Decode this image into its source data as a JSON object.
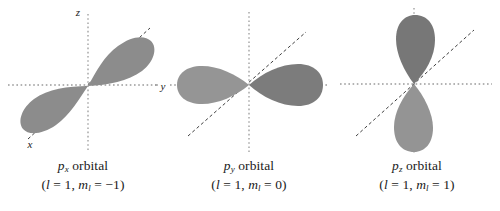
{
  "figure": {
    "background_color": "#ffffff",
    "lobe_color_light": "#8e8e8e",
    "lobe_color_dark": "#7b7b7b",
    "axis_color": "#9a9a9a",
    "diagonal_color": "#3a3a3a",
    "text_color": "#1a1a1a"
  },
  "panels": [
    {
      "id": "px-orbital",
      "orbital_symbol": "p",
      "orbital_subscript": "x",
      "orbital_word": "orbital",
      "quantum_l_symbol": "l",
      "quantum_l_value": "1",
      "quantum_m_symbol": "m",
      "quantum_m_subscript": "l",
      "quantum_m_value": "−1",
      "caption_line1": "pₓ orbital",
      "caption_line2": "(l = 1, mₗ = −1)",
      "axes": [
        {
          "name": "z-axis-label",
          "label": "z"
        },
        {
          "name": "y-axis-label",
          "label": "y"
        },
        {
          "name": "x-axis-label",
          "label": "x"
        }
      ],
      "lobe_orientation": "diagonal-lower-left-to-upper-right",
      "lobe_angle_deg": -30
    },
    {
      "id": "py-orbital",
      "orbital_symbol": "p",
      "orbital_subscript": "y",
      "orbital_word": "orbital",
      "quantum_l_symbol": "l",
      "quantum_l_value": "1",
      "quantum_m_symbol": "m",
      "quantum_m_subscript": "l",
      "quantum_m_value": "0",
      "caption_line1": "pᵧ orbital",
      "caption_line2": "(l = 1, mₗ = 0)",
      "axes": [],
      "lobe_orientation": "horizontal",
      "lobe_angle_deg": 0
    },
    {
      "id": "pz-orbital",
      "orbital_symbol": "p",
      "orbital_subscript": "z",
      "orbital_word": "orbital",
      "quantum_l_symbol": "l",
      "quantum_l_value": "1",
      "quantum_m_symbol": "m",
      "quantum_m_subscript": "l",
      "quantum_m_value": "1",
      "caption_line1": "pᶻ orbital",
      "caption_line2": "(l = 1, mₗ = 1)",
      "axes": [],
      "lobe_orientation": "vertical",
      "lobe_angle_deg": 90
    }
  ],
  "literals": {
    "orbital_word": "orbital",
    "paren_open": "(",
    "paren_close": ")",
    "comma": ",",
    "equals": "=",
    "l_symbol": "l",
    "m_symbol": "m",
    "m_sub": "l",
    "l_value": "1"
  }
}
